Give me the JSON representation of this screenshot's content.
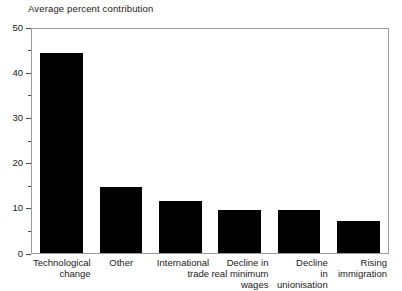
{
  "chart_data": {
    "type": "bar",
    "title": "Average percent contribution",
    "xlabel": "",
    "ylabel": "",
    "ylim": [
      0,
      50
    ],
    "grid": false,
    "legend": null,
    "bar_color": "#000000",
    "frame_color": "#9a9a9a",
    "background_color": "#ffffff",
    "y_ticks_major": [
      0,
      10,
      20,
      30,
      40,
      50
    ],
    "y_ticks_minor": [
      5,
      15,
      25,
      35,
      45
    ],
    "y_tick_labels": [
      "0",
      "10",
      "20",
      "30",
      "40",
      "50"
    ],
    "categories": [
      "Technological change",
      "Other",
      "International trade",
      "Decline in real minimum wages",
      "Decline in unionisation",
      "Rising immigration"
    ],
    "category_lines": [
      [
        "Technological",
        "change"
      ],
      [
        "Other"
      ],
      [
        "International",
        "trade"
      ],
      [
        "Decline in",
        "real minimum",
        "wages"
      ],
      [
        "Decline",
        "in",
        "unionisation"
      ],
      [
        "Rising",
        "immigration"
      ]
    ],
    "values": [
      44.7,
      14.8,
      11.7,
      9.7,
      9.5,
      7.1
    ]
  }
}
